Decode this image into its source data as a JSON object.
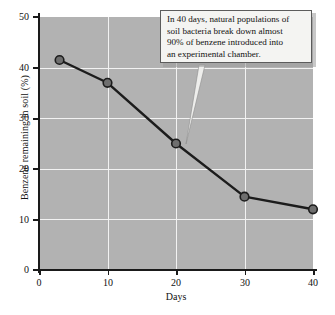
{
  "chart_data": {
    "type": "line",
    "title": "",
    "xlabel": "Days",
    "ylabel": "Benzene remaining in soil (%)",
    "xlim": [
      0,
      40
    ],
    "ylim": [
      0,
      50
    ],
    "grid": true,
    "legend": "none",
    "xticks": [
      "0",
      "10",
      "20",
      "30",
      "40"
    ],
    "xtick_values": [
      0,
      10,
      20,
      30,
      40
    ],
    "yticks": [
      "0",
      "10",
      "20",
      "30",
      "40",
      "50"
    ],
    "ytick_values": [
      0,
      10,
      20,
      30,
      40,
      50
    ],
    "x": [
      3,
      10,
      20,
      30,
      40
    ],
    "values": [
      41.5,
      37,
      25,
      14.5,
      12
    ],
    "series": [
      {
        "name": "Benzene remaining in soil (%)",
        "x": [
          3,
          10,
          20,
          30,
          40
        ],
        "values": [
          41.5,
          37,
          25,
          14.5,
          12
        ],
        "marker": "circle",
        "line_color": "#1c1c1c",
        "marker_color": "#6e6e6e"
      }
    ],
    "annotations": [
      {
        "text": "In 40 days, natural populations of soil bacteria break down almost 90% of benzene introduced into an experimental chamber.",
        "points_to_x": 22,
        "points_to_y": 23
      }
    ],
    "plot_background": "#b2b2b2",
    "gridline_color": "#f2f2f2",
    "axis_color": "#1a1a1a"
  },
  "annotation": {
    "line1": "In 40 days, natural populations of",
    "line2": "soil bacteria break down almost",
    "line3": "90% of benzene introduced into",
    "line4": "an experimental chamber."
  }
}
